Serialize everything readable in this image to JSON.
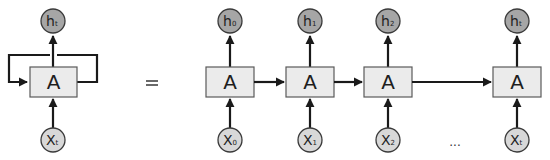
{
  "diagram": {
    "equals_sign": "=",
    "ellipsis": "...",
    "folded": {
      "cell_label": "A",
      "input": {
        "base": "X",
        "sub": "t"
      },
      "output": {
        "base": "h",
        "sub": "t"
      }
    },
    "unrolled": [
      {
        "cell_label": "A",
        "input": {
          "base": "X",
          "sub": "0"
        },
        "output": {
          "base": "h",
          "sub": "0"
        }
      },
      {
        "cell_label": "A",
        "input": {
          "base": "X",
          "sub": "1"
        },
        "output": {
          "base": "h",
          "sub": "1"
        }
      },
      {
        "cell_label": "A",
        "input": {
          "base": "X",
          "sub": "2"
        },
        "output": {
          "base": "h",
          "sub": "2"
        }
      },
      {
        "cell_label": "A",
        "input": {
          "base": "X",
          "sub": "t"
        },
        "output": {
          "base": "h",
          "sub": "t"
        }
      }
    ],
    "colors": {
      "cell_fill": "#ebebeb",
      "output_node_fill": "#a6a6a6",
      "input_node_fill": "#d8d8d8",
      "stroke": "#1a1a1a"
    }
  }
}
